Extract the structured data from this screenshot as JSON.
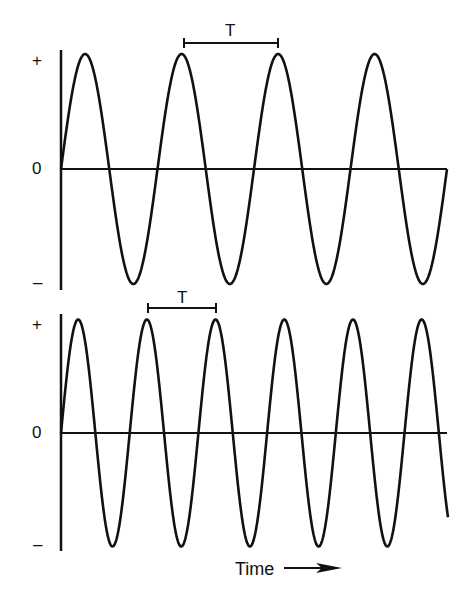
{
  "stroke_color": "#111111",
  "background": "#ffffff",
  "plots": [
    {
      "name": "top-wave",
      "y_labels": {
        "plus": "+",
        "zero": "0",
        "minus": "–"
      },
      "period_label": "T",
      "axis_x": 61,
      "axis_end_x": 447,
      "zero_y": 169,
      "peak_y": 54,
      "trough_y": 284,
      "period_px": 96.5,
      "cycles_visible": 4,
      "period_marker": {
        "x1": 184,
        "x2": 278,
        "y": 43,
        "label_x": 231,
        "label_y": 22
      },
      "label_positions": {
        "plus_y": 52,
        "zero_y": 160,
        "minus_y": 275
      }
    },
    {
      "name": "bottom-wave",
      "y_labels": {
        "plus": "+",
        "zero": "0",
        "minus": "–"
      },
      "period_label": "T",
      "axis_x": 61,
      "axis_end_x": 447,
      "zero_y": 433,
      "peak_y": 318,
      "trough_y": 545,
      "period_px": 68.7,
      "cycles_visible": 5.6,
      "period_marker": {
        "x1": 148,
        "x2": 216,
        "y": 308,
        "label_x": 182,
        "label_y": 289
      },
      "label_positions": {
        "plus_y": 316,
        "zero_y": 424,
        "minus_y": 536
      }
    }
  ],
  "x_axis_label": "Time",
  "x_axis_arrow": "→"
}
